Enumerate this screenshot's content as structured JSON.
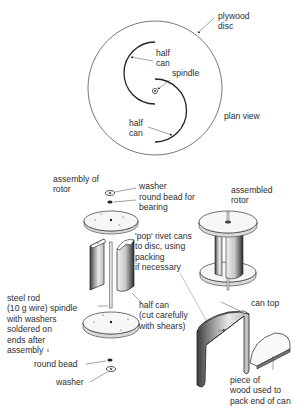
{
  "plan_view": {
    "title": "plan view",
    "labels": {
      "plywood_disc": "plywood\ndisc",
      "half_can_top": "half\ncan",
      "spindle": "spindle",
      "half_can_bottom": "half\ncan"
    }
  },
  "exploded_view": {
    "title": "assembly of\nrotor",
    "labels": {
      "washer_top": "washer",
      "round_bead_bearing": "round bead for\nbearing",
      "pop_rivet": "'pop' rivet cans\nto disc, using\npacking\nif necessary",
      "steel_rod": "steel rod\n(10 g wire) spindle\nwith washers\nsoldered on\nends after\nassembly",
      "half_can_cut": "half can\n(cut carefully\nwith shears)",
      "round_bead_bottom": "round bead",
      "washer_bottom": "washer"
    }
  },
  "assembled_view": {
    "title": "assembled\nrotor"
  },
  "can_detail": {
    "labels": {
      "can_top": "can top",
      "wood_piece": "piece of\nwood used to\npack end of can"
    }
  },
  "colors": {
    "ink": "#2a2a2a",
    "paper": "#ffffff"
  }
}
